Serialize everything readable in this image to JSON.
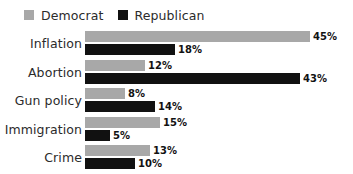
{
  "legend": {
    "position": "top-left",
    "entries": [
      {
        "label": "Democrat",
        "color": "#a8a8a8",
        "icon": "legend-swatch-icon"
      },
      {
        "label": "Republican",
        "color": "#111111",
        "icon": "legend-swatch-icon"
      }
    ]
  },
  "chart_data": {
    "type": "bar",
    "orientation": "horizontal",
    "title": "",
    "subtitle": "",
    "xlabel": "",
    "ylabel": "",
    "grid": false,
    "legend_position": "top-left",
    "value_suffix": "%",
    "xlim": [
      0,
      45
    ],
    "categories": [
      "Inflation",
      "Abortion",
      "Gun policy",
      "Immigration",
      "Crime"
    ],
    "series": [
      {
        "name": "Democrat",
        "color": "#a8a8a8",
        "values": [
          45,
          12,
          8,
          15,
          13
        ],
        "labels": [
          "45%",
          "12%",
          "8%",
          "15%",
          "13%"
        ]
      },
      {
        "name": "Republican",
        "color": "#111111",
        "values": [
          18,
          43,
          14,
          5,
          10
        ],
        "labels": [
          "18%",
          "43%",
          "14%",
          "5%",
          "10%"
        ]
      }
    ]
  }
}
